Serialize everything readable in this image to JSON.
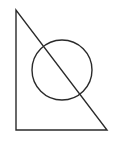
{
  "diagram": {
    "background": "#ffffff",
    "stroke_color": "#2a2a2a",
    "stroke_width": 1.4,
    "triangle": {
      "type": "right-triangle",
      "points": [
        [
          16,
          10
        ],
        [
          16,
          130
        ],
        [
          107,
          130
        ]
      ]
    },
    "circle": {
      "cx": 62,
      "cy": 70,
      "r": 30
    }
  }
}
